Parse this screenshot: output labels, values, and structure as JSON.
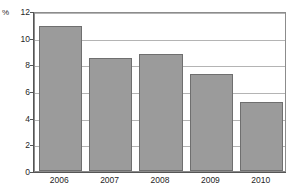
{
  "chart_data": {
    "type": "bar",
    "title": "",
    "subtitle": "",
    "xlabel": "",
    "ylabel": "%",
    "unit_label": "%",
    "categories": [
      "2006",
      "2007",
      "2008",
      "2009",
      "2010"
    ],
    "values": [
      10.9,
      8.5,
      8.8,
      7.3,
      5.2
    ],
    "series": [
      {
        "name": "",
        "values": [
          10.9,
          8.5,
          8.8,
          7.3,
          5.2
        ]
      }
    ],
    "ylim": [
      0,
      12
    ],
    "yticks": [
      0,
      2,
      4,
      6,
      8,
      10,
      12
    ],
    "ytick_labels": [
      "0",
      "2",
      "4",
      "6",
      "8",
      "10",
      "12"
    ],
    "grid": true,
    "grid_axis": "y",
    "legend": false,
    "legend_position": "none",
    "bar_color": "#9b9b9b",
    "bar_border_color": "#6f6f6f",
    "grid_color": "#b4b4b4",
    "axis_color": "#555555",
    "plot_border_color": "#8c8c8c",
    "background_color": "#ffffff",
    "annotations": []
  }
}
